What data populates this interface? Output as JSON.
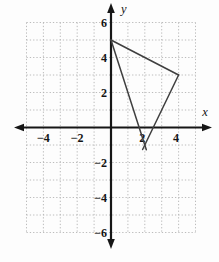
{
  "colors": {
    "background": "#fdfdfd",
    "axis": "#161616",
    "grid": "#b4b4b4",
    "shape": "#3f3f3f",
    "label": "#141414"
  },
  "chart_data": {
    "type": "line",
    "title": "",
    "xlabel": "x",
    "ylabel": "y",
    "xlim": [
      -5,
      5
    ],
    "ylim": [
      -6,
      6
    ],
    "grid": true,
    "legend": false,
    "x_ticks": [
      {
        "value": -4,
        "label": "−4"
      },
      {
        "value": -2,
        "label": "−2"
      },
      {
        "value": 2,
        "label": "2"
      },
      {
        "value": 4,
        "label": "4"
      }
    ],
    "y_ticks": [
      {
        "value": 6,
        "label": "6"
      },
      {
        "value": 4,
        "label": "4"
      },
      {
        "value": 2,
        "label": "2"
      },
      {
        "value": -2,
        "label": "−2"
      },
      {
        "value": -4,
        "label": "−4"
      },
      {
        "value": -6,
        "label": "−6"
      }
    ],
    "series": [
      {
        "name": "triangle",
        "shape": "polygon",
        "closed": true,
        "fill": "none",
        "points": [
          [
            0,
            5
          ],
          [
            4,
            3
          ],
          [
            2,
            -1
          ]
        ]
      }
    ]
  }
}
